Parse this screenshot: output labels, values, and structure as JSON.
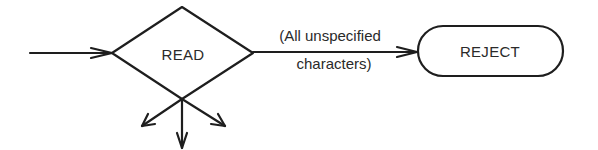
{
  "diagram": {
    "nodes": [
      {
        "id": "read",
        "shape": "diamond",
        "label": "READ"
      },
      {
        "id": "reject",
        "shape": "rounded-rectangle",
        "label": "REJECT"
      }
    ],
    "edges": [
      {
        "from": "entry",
        "to": "read",
        "label": ""
      },
      {
        "from": "read",
        "to": "reject",
        "label_line1": "(All unspecified",
        "label_line2": "characters)"
      },
      {
        "from": "read",
        "to": "down-left",
        "label": ""
      },
      {
        "from": "read",
        "to": "down",
        "label": ""
      },
      {
        "from": "read",
        "to": "down-right",
        "label": ""
      }
    ],
    "colors": {
      "stroke": "#1e1e1e",
      "text": "#2a2a2a",
      "background": "#ffffff"
    }
  }
}
